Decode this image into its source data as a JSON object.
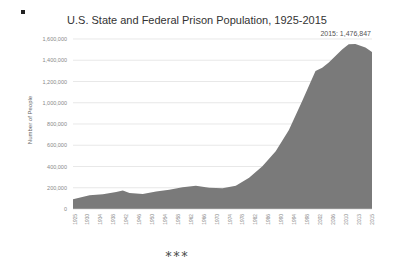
{
  "page": {
    "bullet": "■",
    "separator": "***"
  },
  "chart_data": {
    "type": "area",
    "title": "U.S. State and Federal Prison Population, 1925-2015",
    "xlabel": "",
    "ylabel": "Number of People",
    "ylim": [
      0,
      1600000
    ],
    "yticks": [
      0,
      200000,
      400000,
      600000,
      800000,
      1000000,
      1200000,
      1400000,
      1600000
    ],
    "ytick_labels": [
      "0",
      "200,000",
      "400,000",
      "600,000",
      "800,000",
      "1,000,000",
      "1,200,000",
      "1,400,000",
      "1,600,000"
    ],
    "xtick_labels": [
      "1925",
      "1930",
      "1934",
      "1938",
      "1942",
      "1946",
      "1950",
      "1954",
      "1958",
      "1962",
      "1966",
      "1970",
      "1974",
      "1978",
      "1982",
      "1986",
      "1990",
      "1994",
      "1998",
      "2002",
      "2006",
      "2010",
      "2013",
      "2015"
    ],
    "grid": true,
    "fill_color": "#7a7a7a",
    "annotation": "2015: 1,476,847",
    "x": [
      1925,
      1930,
      1934,
      1938,
      1940,
      1942,
      1946,
      1950,
      1954,
      1958,
      1962,
      1966,
      1970,
      1974,
      1978,
      1982,
      1986,
      1990,
      1994,
      1998,
      2000,
      2002,
      2006,
      2008,
      2010,
      2013,
      2015
    ],
    "values": [
      92000,
      130000,
      138000,
      160000,
      174000,
      150000,
      140000,
      166000,
      182000,
      205000,
      219000,
      200000,
      196000,
      218000,
      294000,
      402000,
      544000,
      743000,
      1016000,
      1300000,
      1330000,
      1380000,
      1500000,
      1550000,
      1552000,
      1520000,
      1476847
    ]
  }
}
